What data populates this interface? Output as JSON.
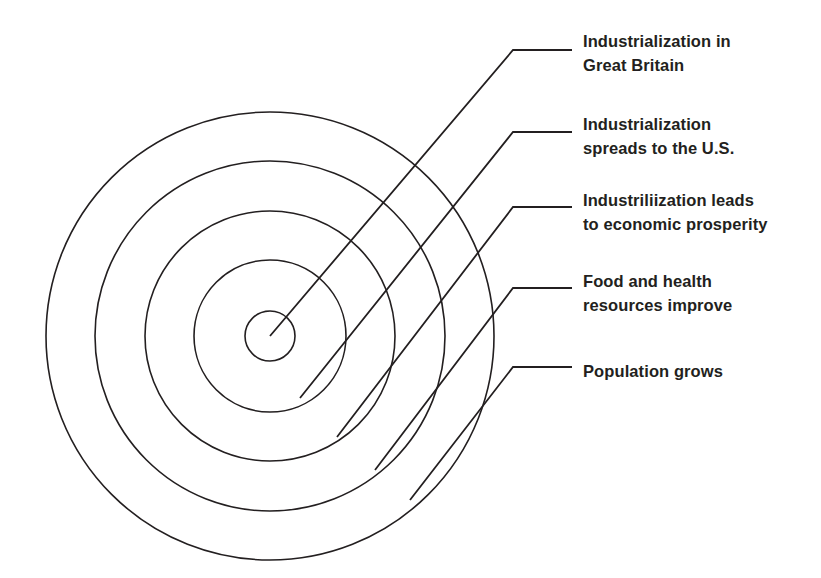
{
  "diagram": {
    "type": "concentric-circles",
    "background_color": "#ffffff",
    "stroke_color": "#231f20",
    "text_color": "#231f20",
    "center": {
      "x": 270,
      "y": 336
    },
    "rings": [
      {
        "index": 1,
        "name": "innermost-ring",
        "radius": 25
      },
      {
        "index": 2,
        "name": "second-ring",
        "radius": 76
      },
      {
        "index": 3,
        "name": "third-ring",
        "radius": 125
      },
      {
        "index": 4,
        "name": "fourth-ring",
        "radius": 175
      },
      {
        "index": 5,
        "name": "outermost-ring",
        "radius": 224
      }
    ],
    "callouts": [
      {
        "id": "callout-1",
        "ring_index": 1,
        "label": "Industrialization in\nGreat Britain",
        "text_x": 583,
        "text_y": 30,
        "leader": {
          "start_x": 270,
          "start_y": 336,
          "bend_x": 513,
          "bend_y": 50,
          "end_x": 572,
          "end_y": 50
        }
      },
      {
        "id": "callout-2",
        "ring_index": 2,
        "label": "Industrialization\nspreads to the U.S.",
        "text_x": 583,
        "text_y": 113,
        "leader": {
          "start_x": 300,
          "start_y": 398,
          "bend_x": 513,
          "bend_y": 132,
          "end_x": 572,
          "end_y": 132
        }
      },
      {
        "id": "callout-3",
        "ring_index": 3,
        "label": "Industriliization leads\nto economic prosperity",
        "text_x": 583,
        "text_y": 189,
        "leader": {
          "start_x": 337,
          "start_y": 437,
          "bend_x": 513,
          "bend_y": 207,
          "end_x": 572,
          "end_y": 207
        }
      },
      {
        "id": "callout-4",
        "ring_index": 4,
        "label": "Food and health\nresources improve",
        "text_x": 583,
        "text_y": 270,
        "leader": {
          "start_x": 375,
          "start_y": 470,
          "bend_x": 513,
          "bend_y": 288,
          "end_x": 572,
          "end_y": 288
        }
      },
      {
        "id": "callout-5",
        "ring_index": 5,
        "label": "Population grows",
        "text_x": 583,
        "text_y": 360,
        "leader": {
          "start_x": 410,
          "start_y": 500,
          "bend_x": 513,
          "bend_y": 367,
          "end_x": 572,
          "end_y": 367
        }
      }
    ]
  }
}
